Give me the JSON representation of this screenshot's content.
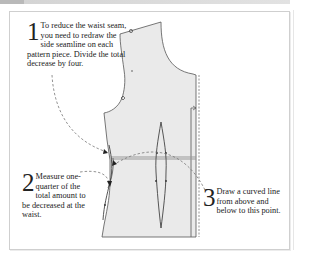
{
  "colors": {
    "pattern_fill": "#eaeaea",
    "outline": "#444444",
    "dashed_arrow": "#777777",
    "waist_line": "#999999",
    "text": "#222222"
  },
  "steps": [
    {
      "number": "1",
      "text": "To reduce the waist seam, you need to redraw the side seamline on each pattern piece. Divide the total decrease by four."
    },
    {
      "number": "2",
      "text": "Measure one-quarter of the total amount to be decreased at the waist."
    },
    {
      "number": "3",
      "text": "Draw a curved line from above and below to this point."
    }
  ]
}
